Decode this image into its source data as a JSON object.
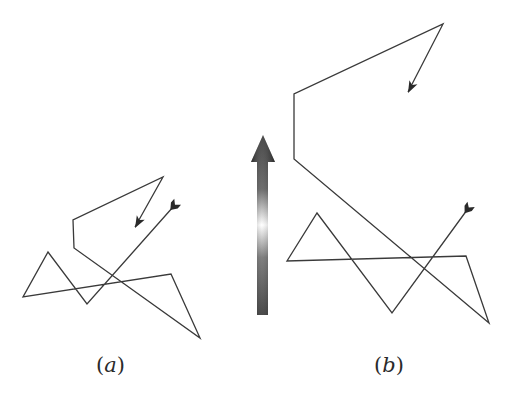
{
  "figure": {
    "panel_a": {
      "label_open": "(",
      "label_letter": "a",
      "label_close": ")",
      "path": [
        [
          173,
          207
        ],
        [
          87,
          304
        ],
        [
          48,
          252
        ],
        [
          23,
          297
        ],
        [
          171,
          274
        ],
        [
          200,
          338
        ],
        [
          74,
          248
        ],
        [
          73,
          220
        ],
        [
          163,
          177
        ],
        [
          135,
          227
        ]
      ],
      "tail": [
        173,
        207
      ],
      "head_tip": [
        135,
        228
      ]
    },
    "panel_b": {
      "label_open": "(",
      "label_letter": "b",
      "label_close": ")",
      "path": [
        [
          467,
          210
        ],
        [
          392,
          313
        ],
        [
          317,
          213
        ],
        [
          287,
          261
        ],
        [
          466,
          256
        ],
        [
          489,
          323
        ],
        [
          294,
          159
        ],
        [
          294,
          94
        ],
        [
          443,
          24
        ],
        [
          408,
          92
        ]
      ],
      "tail": [
        467,
        210
      ],
      "head_tip": [
        408,
        93
      ]
    },
    "center_arrow": {
      "direction": "up",
      "tip": [
        263,
        135
      ],
      "head_base_y": 162,
      "head_half_width": 12,
      "shaft_left": 257,
      "shaft_right": 268,
      "shaft_bottom": 315,
      "colors": {
        "dark": "#2b2b2b",
        "mid": "#7a7a7a",
        "glare": "#ffffff"
      }
    },
    "stroke_color": "#3a3a3a"
  }
}
